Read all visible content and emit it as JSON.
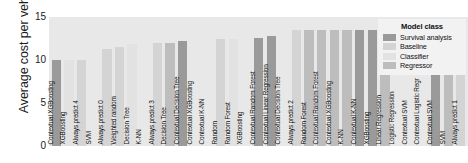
{
  "chart_data": {
    "type": "bar",
    "title": "",
    "xlabel": "",
    "ylabel": "Average cost per vehicle",
    "ylim": [
      0,
      15
    ],
    "yticks": [
      0,
      5,
      10,
      15
    ],
    "grid": false,
    "legend_position": "top-right",
    "legend_title": "Model class",
    "legend": [
      {
        "label": "Survival analysis",
        "color": "#9a9a9a"
      },
      {
        "label": "Baseline",
        "color": "#d4d4d4"
      },
      {
        "label": "Classifier",
        "color": "#e2e2e2"
      },
      {
        "label": "Regressor",
        "color": "#bdbdbd"
      }
    ],
    "categories": [
      "Contextual XGBoosting",
      "XGBoosting",
      "Always predict 4",
      "SVM",
      "Always predict 0",
      "Weighted random",
      "Decision Tree",
      "K-NN",
      "Always predict 3",
      "Decision Tree",
      "Contextual Decision Tree",
      "Contextual XGBoosting",
      "Contextual K-NN",
      "Random",
      "Random Forest",
      "XGBoosting",
      "Contextual Random Forest",
      "Contextual Linear Regression",
      "Contextual Decision Tree",
      "Always predict 2",
      "Random Forest",
      "Contextual Random Forest",
      "Contextual XGBoosting",
      "K-NN",
      "Contextual K-NN",
      "XGBoosting",
      "Linear Regression",
      "Logistic Regression",
      "Contextual SVM",
      "Contextual Logistic Regr",
      "Contextual SVM",
      "SVM",
      "Always predict 1"
    ],
    "values": [
      10.0,
      10.0,
      10.0,
      0.0,
      11.3,
      11.5,
      11.9,
      0.0,
      12.0,
      12.0,
      12.2,
      0.0,
      0.0,
      12.4,
      12.4,
      0.0,
      12.6,
      12.8,
      0.0,
      13.5,
      13.5,
      13.5,
      13.5,
      13.5,
      13.5,
      13.5,
      13.5,
      0.0,
      0.0,
      0.0,
      13.5,
      13.5,
      13.5
    ],
    "classes": [
      "Survival analysis",
      "Classifier",
      "Baseline",
      "Classifier",
      "Baseline",
      "Baseline",
      "Classifier",
      "Classifier",
      "Baseline",
      "Regressor",
      "Survival analysis",
      "Classifier",
      "Classifier",
      "Baseline",
      "Classifier",
      "Regressor",
      "Survival analysis",
      "Survival analysis",
      "Regressor",
      "Baseline",
      "Regressor",
      "Regressor",
      "Regressor",
      "Regressor",
      "Survival analysis",
      "Survival analysis",
      "Regressor",
      "Classifier",
      "Classifier",
      "Survival analysis",
      "Survival analysis",
      "Regressor",
      "Baseline"
    ]
  }
}
